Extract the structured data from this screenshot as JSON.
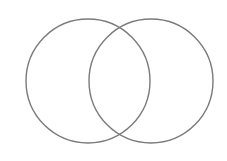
{
  "diagram": {
    "type": "venn",
    "circles": [
      {
        "name": "left-circle",
        "cx": 88,
        "cy": 81,
        "r": 62
      },
      {
        "name": "right-circle",
        "cx": 151,
        "cy": 81,
        "r": 62
      }
    ],
    "stroke_color": "#7a7a7a",
    "background": "#ffffff",
    "labels": []
  }
}
